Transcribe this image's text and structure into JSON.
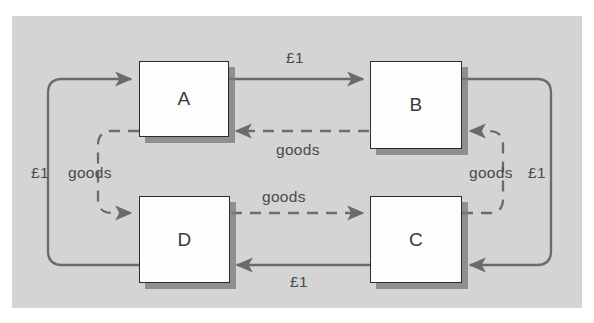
{
  "diagram": {
    "background_color": "#d4d4d4",
    "page_color": "#ffffff",
    "line_color": "#6b6b6b",
    "box_border_color": "#2b2b2b",
    "box_fill_color": "#fdfdfd",
    "shadow_color": "#787878",
    "nodes": [
      {
        "id": "A",
        "label": "A",
        "x": 139,
        "y": 61,
        "w": 90,
        "h": 76
      },
      {
        "id": "B",
        "label": "B",
        "x": 370,
        "y": 61,
        "w": 92,
        "h": 88
      },
      {
        "id": "D",
        "label": "D",
        "x": 139,
        "y": 196,
        "w": 91,
        "h": 87
      },
      {
        "id": "C",
        "label": "C",
        "x": 370,
        "y": 196,
        "w": 92,
        "h": 87
      }
    ],
    "edges": [
      {
        "from": "A",
        "to": "B",
        "label": "£1",
        "style": "solid",
        "position": "top-middle"
      },
      {
        "from": "B",
        "to": "A",
        "label": "goods",
        "style": "dashed",
        "position": "upper-middle"
      },
      {
        "from": "D",
        "to": "C",
        "label": "goods",
        "style": "dashed",
        "position": "lower-middle"
      },
      {
        "from": "C",
        "to": "D",
        "label": "£1",
        "style": "solid",
        "position": "bottom-middle"
      },
      {
        "from": "D",
        "to": "A",
        "label": "£1",
        "style": "solid",
        "position": "left-outer"
      },
      {
        "from": "A",
        "to": "D",
        "label": "goods",
        "style": "dashed",
        "position": "left-inner"
      },
      {
        "from": "B",
        "to": "C",
        "label": "£1",
        "style": "solid",
        "position": "right-outer"
      },
      {
        "from": "C",
        "to": "B",
        "label": "goods",
        "style": "dashed",
        "position": "right-inner"
      }
    ],
    "labels": {
      "top_money": "£1",
      "upper_goods": "goods",
      "left_money": "£1",
      "left_goods": "goods",
      "middle_goods": "goods",
      "right_goods": "goods",
      "right_money": "£1",
      "bottom_money": "£1"
    }
  }
}
